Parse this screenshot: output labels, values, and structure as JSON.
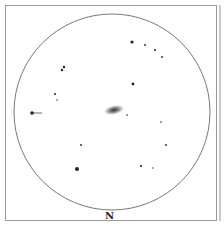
{
  "sketch": {
    "direction_label": "N",
    "field_circle": {
      "cx": 112,
      "cy": 112,
      "r": 98,
      "color": "#555555"
    },
    "galaxy": {
      "cx": 114,
      "cy": 110,
      "rx": 11,
      "ry": 5,
      "core_color": "#444444"
    },
    "stars": [
      {
        "x": 132,
        "y": 42,
        "r": 1.6
      },
      {
        "x": 145,
        "y": 45,
        "r": 0.9
      },
      {
        "x": 155,
        "y": 50,
        "r": 1.0
      },
      {
        "x": 162,
        "y": 57,
        "r": 0.9
      },
      {
        "x": 64,
        "y": 67,
        "r": 1.2
      },
      {
        "x": 62,
        "y": 70,
        "r": 1.2
      },
      {
        "x": 133,
        "y": 84,
        "r": 1.4
      },
      {
        "x": 55,
        "y": 94,
        "r": 1.0
      },
      {
        "x": 57,
        "y": 100,
        "r": 0.7
      },
      {
        "x": 127,
        "y": 115,
        "r": 0.8
      },
      {
        "x": 161,
        "y": 122,
        "r": 0.8
      },
      {
        "x": 166,
        "y": 145,
        "r": 0.9
      },
      {
        "x": 81,
        "y": 145,
        "r": 0.9
      },
      {
        "x": 77,
        "y": 169,
        "r": 2.0
      },
      {
        "x": 141,
        "y": 166,
        "r": 1.1
      },
      {
        "x": 153,
        "y": 168,
        "r": 0.7
      }
    ],
    "arrow": {
      "x1": 32,
      "y1": 113,
      "x2": 42,
      "y2": 113
    }
  }
}
